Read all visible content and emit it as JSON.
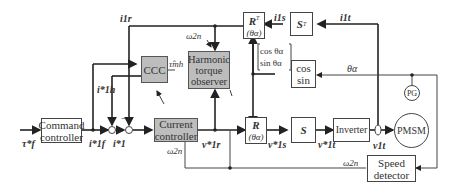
{
  "blocks": {
    "command_controller": "Command\ncontroller",
    "ccc": "CCC",
    "harmonic_observer": "Harmonic\ntorque\nobserver",
    "current_controller": "Current\ncontroller",
    "rt_block_main": "R",
    "rt_block_sup": "T",
    "rt_block_arg": "(θα)",
    "st_block_main": "S",
    "st_block_sup": "T",
    "cos_sin": "cos\nsin",
    "r_block_main": "R",
    "r_block_arg": "(θα)",
    "s_block": "S",
    "inverter": "Inverter",
    "pmsm": "PMSM",
    "pg": "PG",
    "speed_detector": "Speed\ndetector"
  },
  "signals": {
    "tau_f_star": "τ*f",
    "i_1f_star": "i*1f",
    "i_1_star": "i*1",
    "i_1h_star": "i*1h",
    "i_1r": "i1r",
    "i_1s": "i1s",
    "i_1t": "i1t",
    "omega_2n_top": "ω2n",
    "omega_2n_mid": "ω2n",
    "omega_2n_right": "ω2n",
    "tau_mh_hat": "τ̂mh",
    "v_1r_star": "v*1r",
    "v_1s_star": "v*1s",
    "v_1t_star": "v*1t",
    "v_1t": "v1t",
    "theta_alpha": "θα",
    "cos_theta": "cos θα",
    "sin_theta": "sin θα",
    "minus_sign": "−"
  },
  "colors": {
    "block_gray": "#bdbdbd",
    "line": "#222222",
    "thin_line": "#444444"
  }
}
